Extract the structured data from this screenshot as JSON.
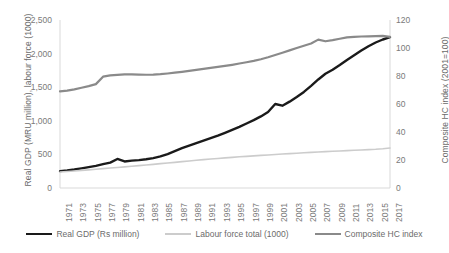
{
  "chart_data": {
    "type": "line",
    "title": "",
    "subtitle": "",
    "xlabel": "",
    "ylabel": "Real GDP (MRU million), labour force (1000)",
    "y2label": "Composite HC index (2001=100)",
    "grid": false,
    "legend_position": "bottom",
    "xlim": [
      1971,
      2017
    ],
    "ylim": [
      0,
      2500
    ],
    "y2lim": [
      0,
      120
    ],
    "yticks": [
      "0",
      "500",
      "1,000",
      "1,500",
      "2,000",
      "2,500"
    ],
    "ytick_values": [
      0,
      500,
      1000,
      1500,
      2000,
      2500
    ],
    "y2ticks": [
      "0",
      "20",
      "40",
      "60",
      "80",
      "100",
      "120"
    ],
    "y2tick_values": [
      0,
      20,
      40,
      60,
      80,
      100,
      120
    ],
    "xticks": [
      "1971",
      "1973",
      "1975",
      "1977",
      "1979",
      "1981",
      "1983",
      "1985",
      "1987",
      "1989",
      "1991",
      "1993",
      "1995",
      "1997",
      "1999",
      "2001",
      "2003",
      "2005",
      "2007",
      "2009",
      "2011",
      "2013",
      "2015",
      "2017"
    ],
    "x": [
      1971,
      1972,
      1973,
      1974,
      1975,
      1976,
      1977,
      1978,
      1979,
      1980,
      1981,
      1982,
      1983,
      1984,
      1985,
      1986,
      1987,
      1988,
      1989,
      1990,
      1991,
      1992,
      1993,
      1994,
      1995,
      1996,
      1997,
      1998,
      1999,
      2000,
      2001,
      2002,
      2003,
      2004,
      2005,
      2006,
      2007,
      2008,
      2009,
      2010,
      2011,
      2012,
      2013,
      2014,
      2015,
      2016,
      2017
    ],
    "series": [
      {
        "name": "Real GDP (Rs million)",
        "axis": "left",
        "color": "#1a1a1a",
        "width": 2.4,
        "values": [
          252,
          262,
          275,
          292,
          310,
          330,
          355,
          378,
          432,
          395,
          408,
          415,
          428,
          445,
          470,
          505,
          548,
          592,
          630,
          668,
          705,
          742,
          780,
          822,
          865,
          910,
          960,
          1010,
          1065,
          1130,
          1250,
          1225,
          1285,
          1355,
          1430,
          1520,
          1615,
          1700,
          1760,
          1830,
          1905,
          1975,
          2045,
          2110,
          2165,
          2210,
          2245
        ]
      },
      {
        "name": "Labour force total (1000)",
        "axis": "left",
        "color": "#cccccc",
        "width": 1.6,
        "values": [
          238,
          246,
          254,
          262,
          270,
          279,
          288,
          297,
          306,
          315,
          324,
          333,
          342,
          352,
          362,
          372,
          382,
          392,
          402,
          412,
          422,
          431,
          440,
          448,
          456,
          464,
          471,
          478,
          485,
          492,
          499,
          506,
          512,
          518,
          524,
          530,
          536,
          541,
          546,
          551,
          556,
          561,
          566,
          571,
          576,
          584,
          595
        ]
      },
      {
        "name": "Composite HC index",
        "axis": "right",
        "color": "#8a8a8a",
        "width": 2.2,
        "values": [
          69.0,
          69.6,
          70.5,
          71.6,
          72.8,
          74.2,
          79.5,
          80.5,
          80.8,
          81.2,
          81.2,
          81.0,
          80.9,
          81.0,
          81.3,
          81.8,
          82.4,
          83.0,
          83.7,
          84.4,
          85.1,
          85.8,
          86.5,
          87.2,
          88.0,
          88.9,
          89.8,
          90.8,
          92.0,
          93.4,
          95.0,
          96.6,
          98.3,
          100.0,
          101.6,
          103.2,
          106.0,
          104.8,
          105.6,
          106.6,
          107.6,
          108.0,
          108.2,
          108.3,
          108.5,
          108.6,
          108.0
        ]
      }
    ]
  },
  "legend": {
    "items": [
      {
        "label": "Real GDP (Rs million)"
      },
      {
        "label": "Labour force total (1000)"
      },
      {
        "label": "Composite HC index"
      }
    ]
  }
}
